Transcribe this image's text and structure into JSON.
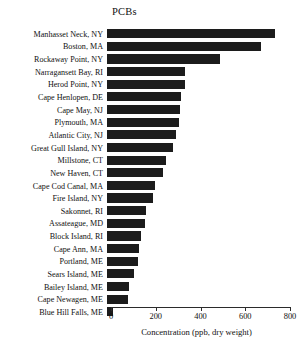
{
  "chart_data": {
    "type": "bar",
    "orientation": "horizontal",
    "title": "PCBs",
    "xlabel": "Concentration (ppb, dry weight)",
    "ylabel": "",
    "xlim": [
      0,
      800
    ],
    "xticks": [
      0,
      200,
      400,
      600,
      800
    ],
    "grid": false,
    "legend": null,
    "bar_color": "#1c1c1c",
    "categories": [
      "Manhasset Neck, NY",
      "Boston, MA",
      "Rockaway Point, NY",
      "Narragansett Bay, RI",
      "Herod Point, NY",
      "Cape Henlopen, DE",
      "Cape May, NJ",
      "Plymouth, MA",
      "Atlantic City, NJ",
      "Great Gull Island, NY",
      "Millstone, CT",
      "New Haven, CT",
      "Cape Cod Canal, MA",
      "Fire Island, NY",
      "Sakonnet, RI",
      "Assateague, MD",
      "Block Island, RI",
      "Cape Ann, MA",
      "Portland, ME",
      "Sears Island, ME",
      "Bailey Island, ME",
      "Cape Newagen, ME",
      "Blue Hill Falls, ME"
    ],
    "values": [
      750,
      690,
      505,
      350,
      350,
      330,
      325,
      320,
      310,
      295,
      265,
      250,
      215,
      205,
      175,
      170,
      150,
      145,
      140,
      120,
      100,
      95,
      25
    ]
  }
}
